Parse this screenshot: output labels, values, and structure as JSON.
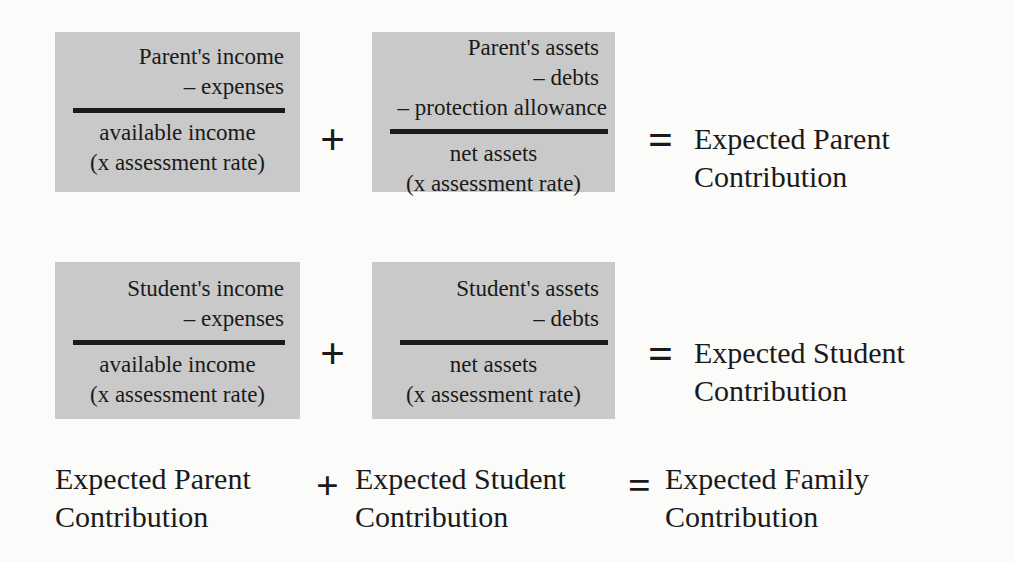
{
  "diagram": {
    "colors": {
      "background": "#fbfbfa",
      "box_fill": "#c9c9c9",
      "ink": "#1a1a1a"
    },
    "rows": [
      {
        "id": "parent",
        "left_box": {
          "name": "parent-income-fraction",
          "numerator": [
            "Parent's income",
            "– expenses"
          ],
          "denominator": [
            "available income",
            "(x assessment rate)"
          ]
        },
        "operator_middle": "+",
        "right_box": {
          "name": "parent-assets-fraction",
          "numerator": [
            "Parent's assets",
            "– debts",
            "– protection allowance"
          ],
          "denominator": [
            "net assets",
            "(x assessment rate)"
          ]
        },
        "operator_end": "=",
        "result": [
          "Expected Parent",
          "Contribution"
        ]
      },
      {
        "id": "student",
        "left_box": {
          "name": "student-income-fraction",
          "numerator": [
            "Student's income",
            "– expenses"
          ],
          "denominator": [
            "available income",
            "(x assessment rate)"
          ]
        },
        "operator_middle": "+",
        "right_box": {
          "name": "student-assets-fraction",
          "numerator": [
            "Student's assets",
            "– debts"
          ],
          "denominator": [
            "net assets",
            "(x assessment rate)"
          ]
        },
        "operator_end": "=",
        "result": [
          "Expected Student",
          "Contribution"
        ]
      }
    ],
    "summary": {
      "term_one": [
        "Expected Parent",
        "Contribution"
      ],
      "operator_middle": "+",
      "term_two": [
        "Expected Student",
        "Contribution"
      ],
      "operator_end": "=",
      "term_three": [
        "Expected Family",
        "Contribution"
      ]
    }
  }
}
